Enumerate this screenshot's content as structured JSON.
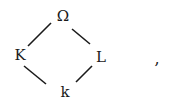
{
  "diagram": {
    "type": "lattice",
    "nodes": [
      {
        "id": "top",
        "label": "Ω"
      },
      {
        "id": "left",
        "label": "K"
      },
      {
        "id": "right",
        "label": "L"
      },
      {
        "id": "bottom",
        "label": "k"
      }
    ],
    "edges": [
      {
        "from": "top",
        "to": "left"
      },
      {
        "from": "top",
        "to": "right"
      },
      {
        "from": "left",
        "to": "bottom"
      },
      {
        "from": "right",
        "to": "bottom"
      }
    ],
    "trailing_punctuation": ","
  }
}
